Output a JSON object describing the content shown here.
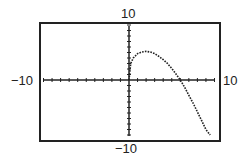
{
  "chart_data": {
    "type": "line",
    "title": "",
    "xlabel": "",
    "ylabel": "",
    "xlim": [
      -10,
      10
    ],
    "ylim": [
      -10,
      10
    ],
    "tick_labels": {
      "x_min": "−10",
      "x_max": "10",
      "y_min": "−10",
      "y_max": "10"
    },
    "grid": false,
    "x_tick_step": 1,
    "y_tick_step": 1,
    "series": [
      {
        "name": "f(x)",
        "style": "dotted",
        "x": [
          0,
          0.2,
          0.5,
          1,
          1.5,
          2,
          2.5,
          3,
          3.5,
          4,
          4.5,
          5,
          5.5,
          6,
          6.5,
          7,
          7.5,
          8,
          8.5,
          9,
          9.5
        ],
        "y": [
          0,
          3.0,
          4.0,
          4.8,
          5.1,
          5.2,
          5.1,
          4.8,
          4.3,
          3.7,
          3.0,
          2.1,
          1.1,
          0.0,
          -1.3,
          -2.8,
          -4.2,
          -5.8,
          -7.4,
          -9.0,
          -10.0
        ]
      }
    ]
  }
}
